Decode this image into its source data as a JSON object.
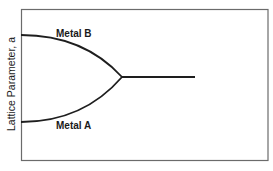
{
  "diagram": {
    "y_axis_label": "Lattice Parameter, a",
    "curves": [
      {
        "name": "Metal B",
        "label": "Metal B",
        "start": [
          21,
          35
        ],
        "end": [
          122,
          77
        ],
        "position": "upper"
      },
      {
        "name": "Metal A",
        "label": "Metal A",
        "start": [
          21,
          122
        ],
        "end": [
          122,
          77
        ],
        "position": "lower"
      }
    ],
    "merged_line": {
      "start": [
        122,
        77
      ],
      "end": [
        195,
        77
      ]
    },
    "colors": {
      "frame": "#6b6b6b",
      "curve": "#1e1e1e",
      "text": "#1a1a1a",
      "background": "#ffffff"
    }
  }
}
